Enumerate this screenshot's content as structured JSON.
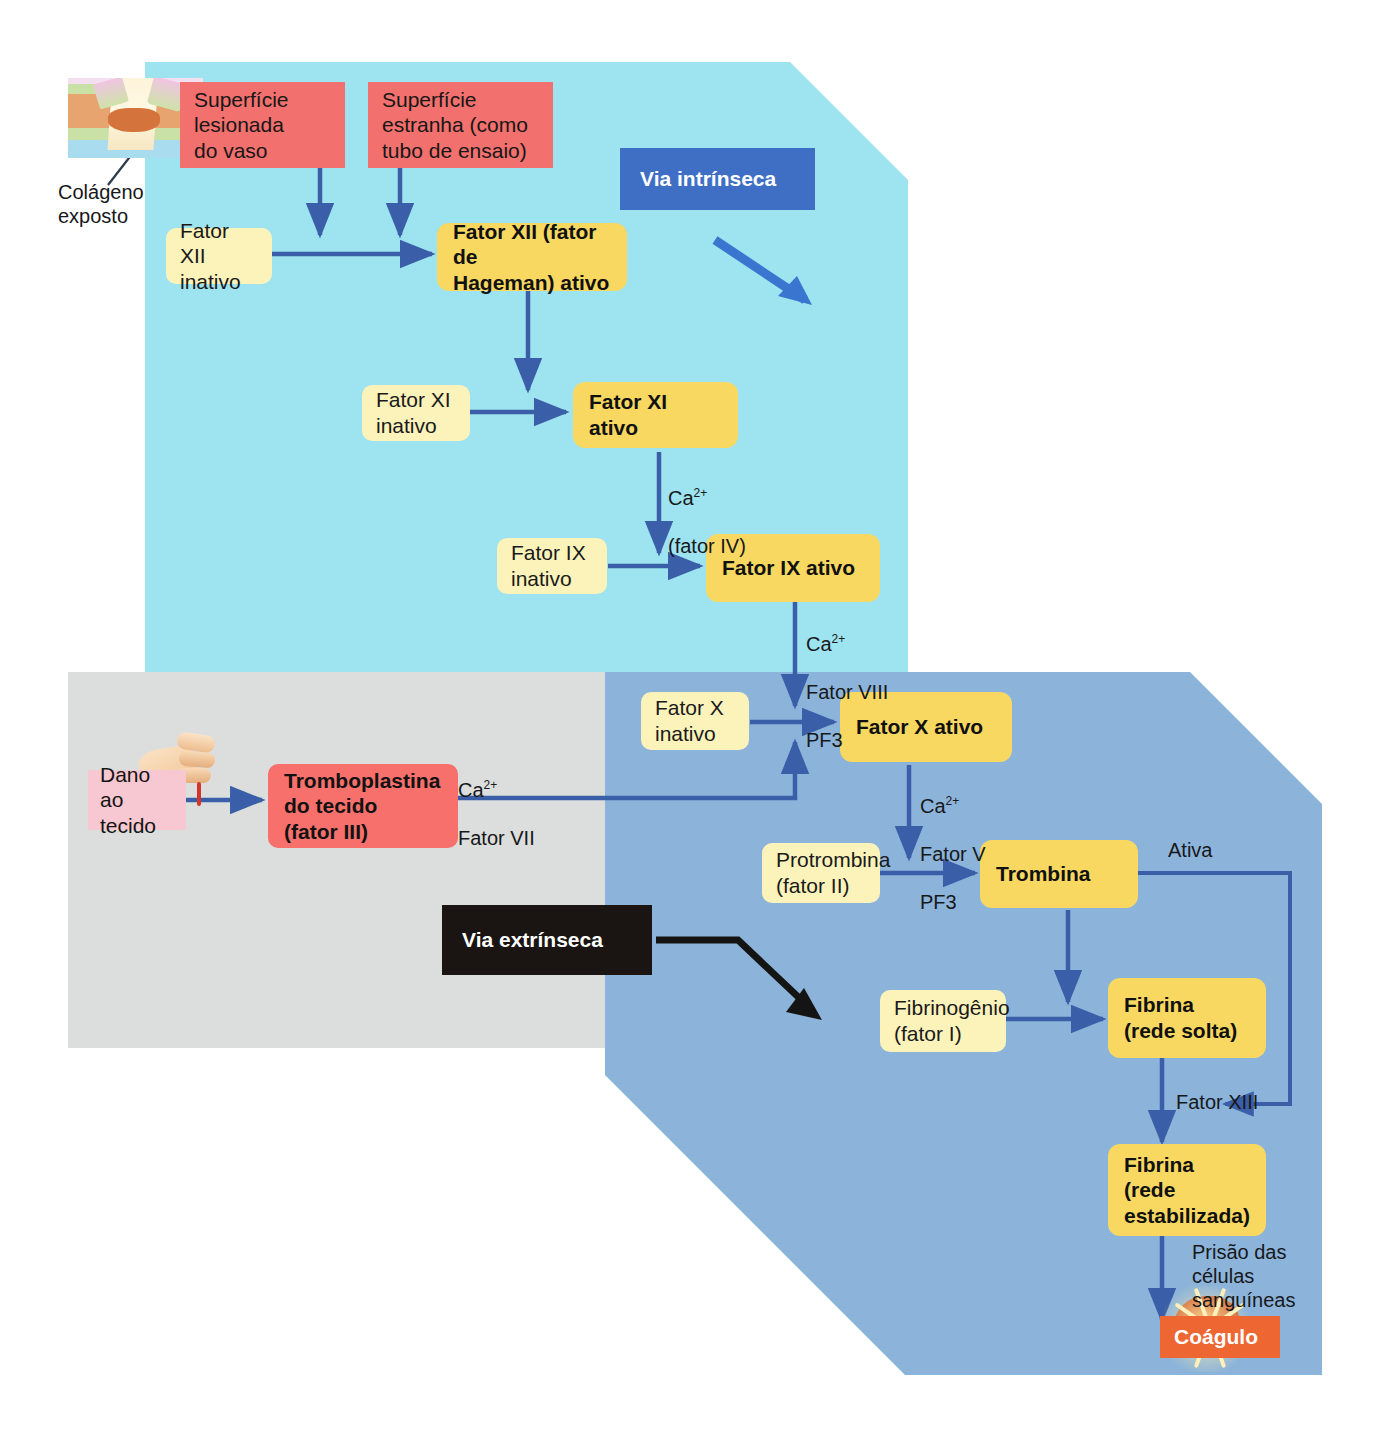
{
  "pathways": {
    "intrinsic": {
      "label": "Via intrínseca",
      "color": "#3f6fc4",
      "band_color": "#9ee3f0"
    },
    "extrinsic": {
      "label": "Via extrínseca",
      "color": "#1a1512",
      "band_color": "#dcdedd"
    },
    "common": {
      "band_color": "#8cb4da"
    }
  },
  "nodes": {
    "vessel_surface": "Superfície\nlesionada\ndo vaso",
    "foreign_surface": "Superfície\nestranha (como\ntubo de ensaio)",
    "factor12_inactive": "Fator XII\ninativo",
    "factor12_active": "Fator XII (fator de\nHageman) ativo",
    "factor11_inactive": "Fator XI\ninativo",
    "factor11_active": "Fator XI ativo",
    "factor9_inactive": "Fator IX\ninativo",
    "factor9_active": "Fator IX ativo",
    "factor10_inactive": "Fator X\ninativo",
    "factor10_active": "Fator X ativo",
    "tissue_damage": "Dano ao\ntecido",
    "tissue_thromboplastin": "Tromboplastina\ndo tecido\n(fator III)",
    "prothrombin": "Protrombina\n(fator II)",
    "thrombin": "Trombina",
    "fibrinogen": "Fibrinogênio\n(fator I)",
    "fibrin_loose": "Fibrina\n(rede solta)",
    "fibrin_stable": "Fibrina\n(rede\nestabilizada)",
    "clot": "Coágulo"
  },
  "annotations": {
    "exposed_collagen": "Colágeno\nexposto",
    "ca_factor4_line1": "Ca",
    "ca_factor4_sup": "2+",
    "ca_factor4_line2": "(fator IV)",
    "ca_factor8_pf3_line1": "Ca",
    "ca_factor8_pf3_sup": "2+",
    "ca_factor8_pf3_line2": "Fator VIII",
    "ca_factor8_pf3_line3": "PF3",
    "ca_factor7_line1": "Ca",
    "ca_factor7_sup": "2+",
    "ca_factor7_line2": "Fator VII",
    "ca_factor5_pf3_line1": "Ca",
    "ca_factor5_pf3_sup": "2+",
    "ca_factor5_pf3_line2": "Fator V",
    "ca_factor5_pf3_line3": "PF3",
    "activates": "Ativa",
    "factor13": "Fator XIII",
    "cell_trapping": "Prisão das\ncélulas\nsanguíneas"
  },
  "colors": {
    "inactive_box": "#fcf3bb",
    "active_box": "#f8d860",
    "surface_box": "#f2706d",
    "tissue_box": "#f8706b",
    "damage_box": "#f8c8d2",
    "clot_box": "#ee6632",
    "arrow": "#3a5fa8",
    "intrinsic_band": "#9ee3f0",
    "extrinsic_band": "#dcdedd",
    "common_band": "#8cb4da"
  }
}
